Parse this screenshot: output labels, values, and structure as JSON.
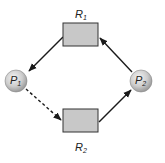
{
  "diagram": {
    "type": "resource-allocation-graph",
    "nodes": {
      "p1": {
        "main": "P",
        "sub": "1",
        "kind": "process"
      },
      "p2": {
        "main": "P",
        "sub": "2",
        "kind": "process"
      },
      "r1": {
        "main": "R",
        "sub": "1",
        "kind": "resource"
      },
      "r2": {
        "main": "R",
        "sub": "2",
        "kind": "resource"
      }
    },
    "edges": [
      {
        "from": "R1",
        "to": "P1",
        "style": "solid",
        "meaning": "assignment"
      },
      {
        "from": "P1",
        "to": "R2",
        "style": "dashed",
        "meaning": "claim"
      },
      {
        "from": "R2",
        "to": "P2",
        "style": "solid",
        "meaning": "assignment"
      },
      {
        "from": "P2",
        "to": "R1",
        "style": "solid",
        "meaning": "request"
      }
    ],
    "colors": {
      "resource_fill": "#c8c8c8",
      "process_fill": "#cfcfcf",
      "stroke": "#1a1a1a"
    }
  }
}
